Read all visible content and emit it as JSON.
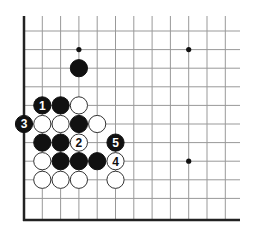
{
  "board": {
    "origin_x": 24,
    "origin_y": 31,
    "spacing_x": 18.3,
    "spacing_y": 18.6,
    "columns": 12,
    "rows": 11,
    "top_y": 16,
    "right_x": 240,
    "bottom_y": 220,
    "line_color": "#999999",
    "edge_color": "#222222",
    "star_points": [
      [
        3,
        1
      ],
      [
        9,
        1
      ],
      [
        9,
        7
      ]
    ]
  },
  "stones": [
    {
      "col": 3,
      "row": 2,
      "color": "black",
      "label": ""
    },
    {
      "col": 1,
      "row": 4,
      "color": "black",
      "label": "1"
    },
    {
      "col": 2,
      "row": 4,
      "color": "black",
      "label": ""
    },
    {
      "col": 3,
      "row": 4,
      "color": "white",
      "label": ""
    },
    {
      "col": 0,
      "row": 5,
      "color": "black",
      "label": "3"
    },
    {
      "col": 1,
      "row": 5,
      "color": "white",
      "label": ""
    },
    {
      "col": 2,
      "row": 5,
      "color": "white",
      "label": ""
    },
    {
      "col": 3,
      "row": 5,
      "color": "black",
      "label": ""
    },
    {
      "col": 4,
      "row": 5,
      "color": "white",
      "label": ""
    },
    {
      "col": 1,
      "row": 6,
      "color": "black",
      "label": ""
    },
    {
      "col": 2,
      "row": 6,
      "color": "black",
      "label": ""
    },
    {
      "col": 3,
      "row": 6,
      "color": "white",
      "label": "2"
    },
    {
      "col": 5,
      "row": 6,
      "color": "black",
      "label": "5"
    },
    {
      "col": 1,
      "row": 7,
      "color": "white",
      "label": ""
    },
    {
      "col": 2,
      "row": 7,
      "color": "black",
      "label": ""
    },
    {
      "col": 3,
      "row": 7,
      "color": "black",
      "label": ""
    },
    {
      "col": 4,
      "row": 7,
      "color": "black",
      "label": ""
    },
    {
      "col": 5,
      "row": 7,
      "color": "white",
      "label": "4"
    },
    {
      "col": 1,
      "row": 8,
      "color": "white",
      "label": ""
    },
    {
      "col": 2,
      "row": 8,
      "color": "white",
      "label": ""
    },
    {
      "col": 3,
      "row": 8,
      "color": "white",
      "label": ""
    },
    {
      "col": 5,
      "row": 8,
      "color": "white",
      "label": ""
    }
  ]
}
